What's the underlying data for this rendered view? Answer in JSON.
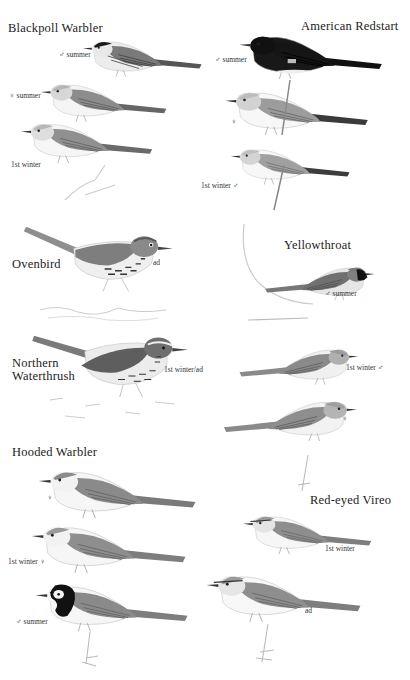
{
  "plate": {
    "background": "#ffffff",
    "species": [
      {
        "name": "Blackpoll Warbler",
        "figures": [
          {
            "label": "♂ summer"
          },
          {
            "label": "♀ summer"
          },
          {
            "label": "1st winter"
          }
        ]
      },
      {
        "name": "American Redstart",
        "figures": [
          {
            "label": "♂ summer"
          },
          {
            "label": "♀"
          },
          {
            "label": "1st winter ♂"
          }
        ]
      },
      {
        "name": "Ovenbird",
        "figures": [
          {
            "label": "ad"
          }
        ]
      },
      {
        "name": "Yellowthroat",
        "figures": [
          {
            "label": "♂ summer"
          },
          {
            "label": "1st winter ♂"
          },
          {
            "label": "♀"
          }
        ]
      },
      {
        "name_line1": "Northern",
        "name_line2": "Waterthrush",
        "figures": [
          {
            "label": "1st winter/ad"
          }
        ]
      },
      {
        "name": "Hooded Warbler",
        "figures": [
          {
            "label": "♀"
          },
          {
            "label": "1st winter ♀"
          },
          {
            "label": "♂ summer"
          }
        ]
      },
      {
        "name": "Red-eyed Vireo",
        "figures": [
          {
            "label": "1st winter"
          },
          {
            "label": "ad"
          }
        ]
      }
    ]
  }
}
